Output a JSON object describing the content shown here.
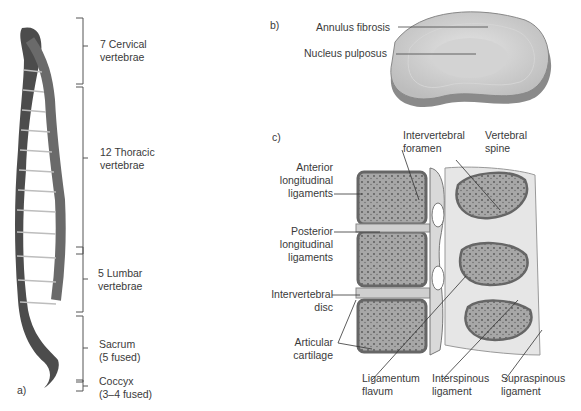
{
  "panel_a": {
    "tag": "a)",
    "regions": [
      {
        "line1": "7 Cervical",
        "line2": "vertebrae"
      },
      {
        "line1": "12 Thoracic",
        "line2": "vertebrae"
      },
      {
        "line1": "5 Lumbar",
        "line2": "vertebrae"
      },
      {
        "line1": "Sacrum",
        "line2": "(5 fused)"
      },
      {
        "line1": "Coccyx",
        "line2": "(3–4 fused)"
      }
    ]
  },
  "panel_b": {
    "tag": "b)",
    "labels": [
      "Annulus fibrosis",
      "Nucleus pulposus"
    ]
  },
  "panel_c": {
    "tag": "c)",
    "top_labels": [
      {
        "line1": "Intervertebral",
        "line2": "foramen"
      },
      {
        "line1": "Vertebral",
        "line2": "spine"
      }
    ],
    "left_labels": [
      {
        "lines": [
          "Anterior",
          "longitudinal",
          "ligaments"
        ]
      },
      {
        "lines": [
          "Posterior",
          "longitudinal",
          "ligaments"
        ]
      },
      {
        "lines": [
          "Intervertebral",
          "disc"
        ]
      },
      {
        "lines": [
          "Articular",
          "cartilage"
        ]
      }
    ],
    "bottom_labels": [
      {
        "line1": "Ligamentum",
        "line2": "flavum"
      },
      {
        "line1": "Interspinous",
        "line2": "ligament"
      },
      {
        "line1": "Supraspinous",
        "line2": "ligament"
      }
    ]
  },
  "colors": {
    "bone_dark": "#4a4a4a",
    "bone_light": "#8a8a8a",
    "disc": "#cfcfcf",
    "line": "#444444"
  }
}
